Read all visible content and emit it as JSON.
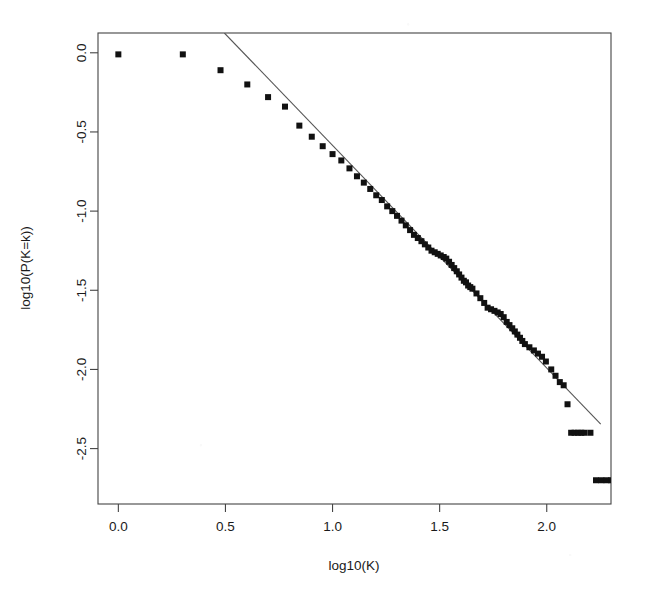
{
  "figure": {
    "kind": "scatter-with-fit-line",
    "background": "#ffffff",
    "marker_color": "#111111",
    "line_color": "#555555",
    "axis_color": "#444444"
  },
  "chart_data": {
    "type": "scatter",
    "title": "",
    "subtitle": "",
    "xlabel": "log10(K)",
    "ylabel": "log10(P(K=k))",
    "xlim": [
      -0.095,
      2.3
    ],
    "ylim": [
      -2.85,
      0.125
    ],
    "xticks": [
      0.0,
      0.5,
      1.0,
      1.5,
      2.0
    ],
    "xticklabels": [
      "0.0",
      "0.5",
      "1.0",
      "1.5",
      "2.0"
    ],
    "yticks": [
      0.0,
      -0.5,
      -1.0,
      -1.5,
      -2.0,
      -2.5
    ],
    "yticklabels": [
      "0.0",
      "-0.5",
      "-1.0",
      "-1.5",
      "-2.0",
      "-2.5"
    ],
    "grid": false,
    "legend": null,
    "marker": "square",
    "marker_size": 6,
    "x": [
      0.0,
      0.301,
      0.477,
      0.602,
      0.699,
      0.778,
      0.845,
      0.903,
      0.954,
      1.0,
      1.041,
      1.079,
      1.114,
      1.146,
      1.176,
      1.204,
      1.23,
      1.255,
      1.279,
      1.301,
      1.322,
      1.342,
      1.362,
      1.38,
      1.398,
      1.415,
      1.431,
      1.447,
      1.462,
      1.477,
      1.491,
      1.505,
      1.519,
      1.531,
      1.544,
      1.556,
      1.568,
      1.58,
      1.591,
      1.602,
      1.613,
      1.623,
      1.633,
      1.643,
      1.653,
      1.672,
      1.69,
      1.708,
      1.724,
      1.74,
      1.756,
      1.771,
      1.785,
      1.799,
      1.813,
      1.826,
      1.839,
      1.851,
      1.863,
      1.875,
      1.886,
      1.898,
      1.919,
      1.94,
      1.959,
      1.978,
      1.996,
      2.021,
      2.041,
      2.061,
      2.079,
      2.097,
      2.114,
      2.13,
      2.146,
      2.161,
      2.176,
      2.204,
      2.23,
      2.255,
      2.279,
      2.301
    ],
    "y": [
      -0.01,
      -0.01,
      -0.11,
      -0.2,
      -0.28,
      -0.34,
      -0.46,
      -0.53,
      -0.59,
      -0.64,
      -0.68,
      -0.73,
      -0.78,
      -0.82,
      -0.86,
      -0.9,
      -0.93,
      -0.97,
      -1.0,
      -1.03,
      -1.06,
      -1.09,
      -1.12,
      -1.15,
      -1.17,
      -1.19,
      -1.21,
      -1.23,
      -1.25,
      -1.26,
      -1.27,
      -1.28,
      -1.29,
      -1.3,
      -1.32,
      -1.34,
      -1.36,
      -1.38,
      -1.4,
      -1.42,
      -1.44,
      -1.45,
      -1.47,
      -1.48,
      -1.49,
      -1.52,
      -1.55,
      -1.58,
      -1.61,
      -1.62,
      -1.63,
      -1.64,
      -1.65,
      -1.67,
      -1.7,
      -1.72,
      -1.74,
      -1.76,
      -1.78,
      -1.8,
      -1.82,
      -1.84,
      -1.86,
      -1.88,
      -1.9,
      -1.92,
      -1.95,
      -2.0,
      -2.04,
      -2.08,
      -2.1,
      -2.22,
      -2.4,
      -2.4,
      -2.4,
      -2.4,
      -2.4,
      -2.4,
      -2.7,
      -2.7,
      -2.7,
      -2.7
    ],
    "fit_line": {
      "label": "power-law fit",
      "x_start": 0.495,
      "y_start": 0.125,
      "x_end": 2.252,
      "y_end": -2.345,
      "slope": -1.41,
      "intercept": 0.82
    }
  },
  "axis_titles": {
    "x": "log10(K)",
    "y": "log10(P(K=k))"
  }
}
